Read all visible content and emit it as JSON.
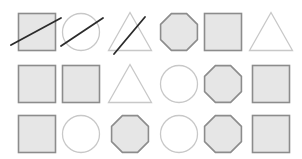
{
  "colors": {
    "background": "#ffffff",
    "filled_fill": "#e6e6e6",
    "filled_stroke": "#8c8c8c",
    "outline_stroke": "#c8c8c8",
    "slash_stroke": "#2b2b2b"
  },
  "grid": {
    "rows": 3,
    "cols": 6,
    "col_centers": [
      37,
      81,
      130,
      179,
      223,
      271
    ],
    "row_centers": [
      32,
      84,
      134
    ],
    "size": 37
  },
  "shapes": [
    {
      "row": 0,
      "col": 0,
      "type": "square",
      "filled": true,
      "crossed": true
    },
    {
      "row": 0,
      "col": 1,
      "type": "circle",
      "filled": false,
      "crossed": true
    },
    {
      "row": 0,
      "col": 2,
      "type": "triangle",
      "filled": false,
      "crossed": true
    },
    {
      "row": 0,
      "col": 3,
      "type": "octagon",
      "filled": true,
      "crossed": false
    },
    {
      "row": 0,
      "col": 4,
      "type": "square",
      "filled": true,
      "crossed": false
    },
    {
      "row": 0,
      "col": 5,
      "type": "triangle",
      "filled": false,
      "crossed": false
    },
    {
      "row": 1,
      "col": 0,
      "type": "square",
      "filled": true,
      "crossed": false
    },
    {
      "row": 1,
      "col": 1,
      "type": "square",
      "filled": true,
      "crossed": false
    },
    {
      "row": 1,
      "col": 2,
      "type": "triangle",
      "filled": false,
      "crossed": false
    },
    {
      "row": 1,
      "col": 3,
      "type": "circle",
      "filled": false,
      "crossed": false
    },
    {
      "row": 1,
      "col": 4,
      "type": "octagon",
      "filled": true,
      "crossed": false
    },
    {
      "row": 1,
      "col": 5,
      "type": "square",
      "filled": true,
      "crossed": false
    },
    {
      "row": 2,
      "col": 0,
      "type": "square",
      "filled": true,
      "crossed": false
    },
    {
      "row": 2,
      "col": 1,
      "type": "circle",
      "filled": false,
      "crossed": false
    },
    {
      "row": 2,
      "col": 2,
      "type": "octagon",
      "filled": true,
      "crossed": false
    },
    {
      "row": 2,
      "col": 3,
      "type": "circle",
      "filled": false,
      "crossed": false
    },
    {
      "row": 2,
      "col": 4,
      "type": "octagon",
      "filled": true,
      "crossed": false
    },
    {
      "row": 2,
      "col": 5,
      "type": "square",
      "filled": true,
      "crossed": false
    }
  ],
  "slashes": [
    {
      "x1": 11,
      "y1": 45,
      "x2": 61,
      "y2": 18
    },
    {
      "x1": 61,
      "y1": 46,
      "x2": 103,
      "y2": 18
    },
    {
      "x1": 114,
      "y1": 54,
      "x2": 145,
      "y2": 17
    }
  ]
}
